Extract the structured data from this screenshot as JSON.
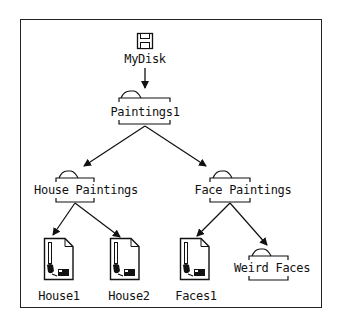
{
  "diagram": {
    "nodes": [
      {
        "id": "mydisk",
        "type": "disk",
        "label": "MyDisk"
      },
      {
        "id": "paintings1",
        "type": "folder",
        "label": "Paintings1",
        "parent": "mydisk"
      },
      {
        "id": "house_paintings",
        "type": "folder",
        "label": "House Paintings",
        "parent": "paintings1"
      },
      {
        "id": "face_paintings",
        "type": "folder",
        "label": "Face Paintings",
        "parent": "paintings1"
      },
      {
        "id": "house1",
        "type": "document",
        "label": "House1",
        "parent": "house_paintings"
      },
      {
        "id": "house2",
        "type": "document",
        "label": "House2",
        "parent": "house_paintings"
      },
      {
        "id": "faces1",
        "type": "document",
        "label": "Faces1",
        "parent": "face_paintings"
      },
      {
        "id": "weird_faces",
        "type": "folder",
        "label": "Weird Faces",
        "parent": "face_paintings"
      }
    ],
    "icons": {
      "disk": "floppy-disk-icon",
      "folder": "folder-icon",
      "document": "paint-document-icon"
    }
  }
}
